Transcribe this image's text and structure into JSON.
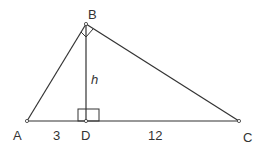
{
  "diagram": {
    "vertices": {
      "A": "A",
      "B": "B",
      "C": "C",
      "D": "D"
    },
    "segment_labels": {
      "AD": "3",
      "DC": "12",
      "BD": "h"
    },
    "right_angles": [
      "ABC",
      "BDC"
    ],
    "colors": {
      "stroke": "#333333",
      "background": "#ffffff"
    }
  }
}
